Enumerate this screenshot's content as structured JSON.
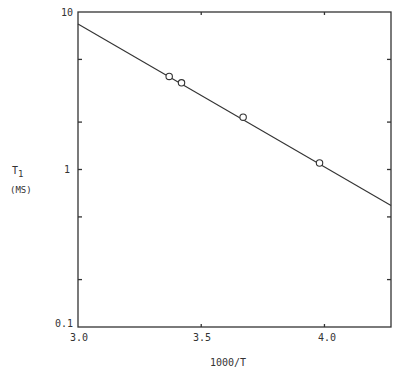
{
  "chart_data": {
    "type": "line",
    "title": "",
    "xlabel": "1000/T",
    "ylabel": "T1",
    "ylabel_unit": "(MS)",
    "xscale": "linear",
    "yscale": "log",
    "xlim": [
      3.0,
      4.27
    ],
    "ylim": [
      0.1,
      10
    ],
    "x_ticks": [
      "3.0",
      "3.5",
      "4.0"
    ],
    "y_ticks": [
      "0.1",
      "1",
      "10"
    ],
    "grid": false,
    "series": [
      {
        "name": "measured",
        "marker": "open-circle",
        "x": [
          3.37,
          3.42,
          3.67,
          3.98
        ],
        "y": [
          3.9,
          3.55,
          2.15,
          1.1
        ]
      },
      {
        "name": "fit",
        "marker": "none",
        "x": [
          3.0,
          4.27
        ],
        "y": [
          8.4,
          0.59
        ]
      }
    ]
  },
  "axes": {
    "y_label_main": "T",
    "y_label_sub": "1",
    "y_label_unit": "(MS)",
    "x_label": "1000/T",
    "y_tick_10": "10",
    "y_tick_1": "1",
    "y_tick_01": "0.1",
    "x_tick_30": "3.0",
    "x_tick_35": "3.5",
    "x_tick_40": "4.0"
  }
}
